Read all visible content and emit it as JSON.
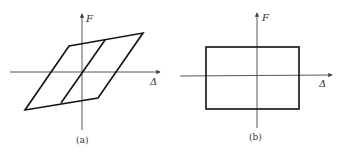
{
  "figure": {
    "panels": [
      {
        "id": "a",
        "caption": "(a)",
        "y_axis_label": "F",
        "x_axis_label": "Δ",
        "shape": "parallelogram hysteresis loop with central skewed line",
        "points": {
          "top_left": [
            69,
            46
          ],
          "top_right": [
            143,
            33
          ],
          "bottom_right": [
            98,
            98
          ],
          "bottom_left": [
            25,
            110
          ],
          "inner_line_top": [
            105,
            40
          ],
          "inner_line_bottom": [
            61,
            103
          ]
        }
      },
      {
        "id": "b",
        "caption": "(b)",
        "y_axis_label": "F",
        "x_axis_label": "Δ",
        "shape": "rectangular hysteresis loop",
        "points": {
          "top_left": [
            206,
            47
          ],
          "bottom_right": [
            299,
            109
          ]
        }
      }
    ],
    "colors": {
      "axis": "#444444",
      "curve": "#111111",
      "text": "#333333",
      "background": "#ffffff"
    }
  }
}
